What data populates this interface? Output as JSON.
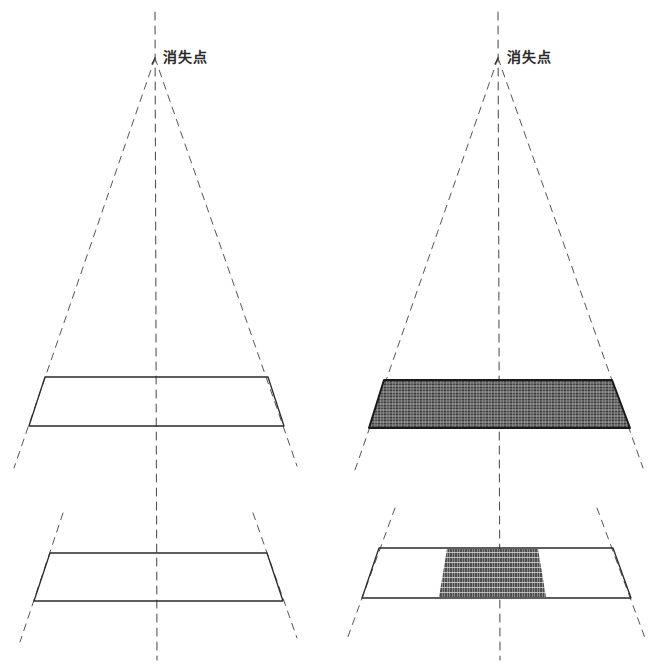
{
  "diagram": {
    "title": "",
    "canvas": {
      "width": 658,
      "height": 667
    },
    "colors": {
      "background": "#ffffff",
      "ink": "#2a2a2a",
      "dash": "#555555",
      "hatch_dark": "#1e1e1e",
      "hatch_light": "#8a8a8a"
    },
    "panels": [
      {
        "id": "left",
        "vanishing_point": {
          "label": "消失点",
          "x": 155,
          "y": 58,
          "label_x": 163,
          "label_y": 50
        },
        "center_axis_x": 155,
        "upper_trapezoid": {
          "top": {
            "y": 377,
            "x1": 45,
            "x2": 268
          },
          "bottom": {
            "y": 426,
            "x1": 29,
            "x2": 284
          },
          "fill": "none"
        },
        "lower_trapezoid": {
          "top": {
            "y": 553,
            "x1": 50,
            "x2": 267
          },
          "bottom": {
            "y": 601,
            "x1": 34,
            "x2": 283
          },
          "fill": "none"
        },
        "convergence_lines": {
          "upper_left_end": {
            "x": 14,
            "y": 468
          },
          "upper_right_end": {
            "x": 297,
            "y": 466
          },
          "lower_left_top": {
            "x": 63,
            "y": 513
          },
          "lower_left_end": {
            "x": 20,
            "y": 642
          },
          "lower_right_top": {
            "x": 253,
            "y": 513
          },
          "lower_right_end": {
            "x": 297,
            "y": 638
          }
        }
      },
      {
        "id": "right",
        "vanishing_point": {
          "label": "消失点",
          "x": 498,
          "y": 58,
          "label_x": 507,
          "label_y": 50
        },
        "center_axis_x": 498,
        "upper_trapezoid": {
          "top": {
            "y": 380,
            "x1": 384,
            "x2": 612
          },
          "bottom": {
            "y": 428,
            "x1": 369,
            "x2": 630
          },
          "fill": "hatched"
        },
        "lower_trapezoid": {
          "top": {
            "y": 548,
            "x1": 379,
            "x2": 613
          },
          "bottom": {
            "y": 598,
            "x1": 362,
            "x2": 631
          },
          "fill": "partial",
          "hatched_patch": {
            "top_x1": 447,
            "top_x2": 538,
            "bottom_x1": 439,
            "bottom_x2": 546
          }
        },
        "convergence_lines": {
          "upper_left_end": {
            "x": 355,
            "y": 470
          },
          "upper_right_end": {
            "x": 643,
            "y": 468
          },
          "lower_left_top": {
            "x": 395,
            "y": 508
          },
          "lower_left_end": {
            "x": 346,
            "y": 642
          },
          "lower_right_top": {
            "x": 597,
            "y": 508
          },
          "lower_right_end": {
            "x": 645,
            "y": 638
          }
        }
      }
    ]
  }
}
